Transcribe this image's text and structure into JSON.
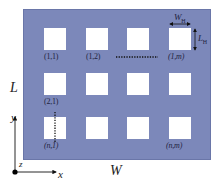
{
  "diagram": {
    "type": "perforated-plate-schematic",
    "colors": {
      "plate": "#7c88ba",
      "hole": "#ffffff",
      "text": "#1f2340"
    },
    "dimensions": {
      "length_label": "L",
      "width_label": "W",
      "hole_width_label": "W_H",
      "hole_length_label": "L_H"
    },
    "holes": {
      "labels": {
        "r1c1": "(1,1)",
        "r1c2": "(1,2)",
        "r1cm": "(1,m)",
        "r2c1": "(2,1)",
        "rnc1": "(n,1)",
        "rncm": "(n,m)"
      },
      "grid_shown": {
        "rows": 3,
        "cols": 4
      }
    },
    "axes": {
      "x": "x",
      "y": "y",
      "z": "z"
    }
  }
}
